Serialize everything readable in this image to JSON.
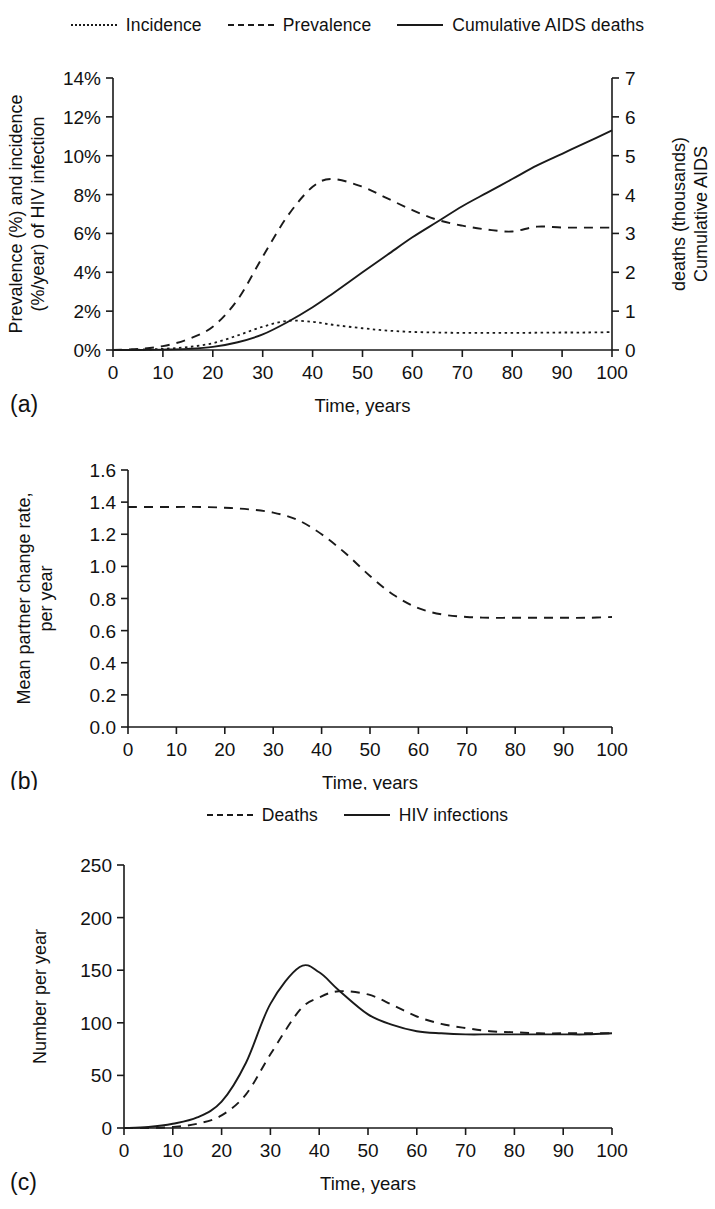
{
  "figure": {
    "panels": [
      "(a)",
      "(b)",
      "(c)"
    ],
    "x_axis_title": "Time, years"
  },
  "panel_a": {
    "tag": "(a)",
    "legend": [
      {
        "label": "Incidence",
        "style": "dotted"
      },
      {
        "label": "Prevalence",
        "style": "dashed"
      },
      {
        "label": "Cumulative AIDS deaths",
        "style": "solid"
      }
    ],
    "y_left_label_line1": "Prevalence (%) and incidence",
    "y_left_label_line2": "(%/year) of HIV infection",
    "y_right_label_line1": "Cumulative AIDS",
    "y_right_label_line2": "deaths (thousands)",
    "x_label": "Time, years",
    "y_left_ticks": [
      "0%",
      "2%",
      "4%",
      "6%",
      "8%",
      "10%",
      "12%",
      "14%"
    ],
    "y_right_ticks": [
      "0",
      "1",
      "2",
      "3",
      "4",
      "5",
      "6",
      "7"
    ],
    "x_ticks": [
      "0",
      "10",
      "20",
      "30",
      "40",
      "50",
      "60",
      "70",
      "80",
      "90",
      "100"
    ]
  },
  "panel_b": {
    "tag": "(b)",
    "y_label_line1": "Mean partner change rate,",
    "y_label_line2": "per year",
    "x_label": "Time, years",
    "y_ticks": [
      "0.0",
      "0.2",
      "0.4",
      "0.6",
      "0.8",
      "1.0",
      "1.2",
      "1.4",
      "1.6"
    ],
    "x_ticks": [
      "0",
      "10",
      "20",
      "30",
      "40",
      "50",
      "60",
      "70",
      "80",
      "90",
      "100"
    ]
  },
  "panel_c": {
    "tag": "(c)",
    "legend": [
      {
        "label": "Deaths",
        "style": "dashed"
      },
      {
        "label": "HIV infections",
        "style": "solid"
      }
    ],
    "y_label": "Number per year",
    "x_label": "Time, years",
    "y_ticks": [
      "0",
      "50",
      "100",
      "150",
      "200",
      "250"
    ],
    "x_ticks": [
      "0",
      "10",
      "20",
      "30",
      "40",
      "50",
      "60",
      "70",
      "80",
      "90",
      "100"
    ]
  },
  "chart_data": [
    {
      "id": "a",
      "type": "line",
      "title": "",
      "xlabel": "Time, years",
      "ylabel": "Prevalence (%) and incidence (%/year) of HIV infection",
      "y2label": "Cumulative AIDS deaths (thousands)",
      "xlim": [
        0,
        100
      ],
      "ylim": [
        0,
        14
      ],
      "y2lim": [
        0,
        7
      ],
      "yticks": [
        0,
        2,
        4,
        6,
        8,
        10,
        12,
        14
      ],
      "y2ticks": [
        0,
        1,
        2,
        3,
        4,
        5,
        6,
        7
      ],
      "xticks": [
        0,
        10,
        20,
        30,
        40,
        50,
        60,
        70,
        80,
        90,
        100
      ],
      "grid": false,
      "legend_position": "top",
      "x": [
        0,
        5,
        10,
        15,
        20,
        25,
        30,
        35,
        40,
        44,
        50,
        55,
        60,
        65,
        70,
        75,
        80,
        85,
        90,
        95,
        100
      ],
      "series": [
        {
          "name": "Incidence",
          "style": "dotted",
          "axis": "left",
          "units": "%/year",
          "values": [
            0.0,
            0.02,
            0.06,
            0.15,
            0.35,
            0.75,
            1.2,
            1.5,
            1.45,
            1.3,
            1.12,
            1.0,
            0.93,
            0.9,
            0.88,
            0.88,
            0.88,
            0.89,
            0.9,
            0.9,
            0.92
          ]
        },
        {
          "name": "Prevalence",
          "style": "dashed",
          "axis": "left",
          "units": "%",
          "values": [
            0.0,
            0.05,
            0.2,
            0.55,
            1.2,
            2.6,
            4.8,
            6.9,
            8.4,
            8.8,
            8.4,
            7.8,
            7.2,
            6.7,
            6.4,
            6.2,
            6.1,
            6.35,
            6.3,
            6.3,
            6.3
          ]
        },
        {
          "name": "Cumulative AIDS deaths",
          "style": "solid",
          "axis": "right",
          "units": "thousands",
          "values": [
            0.0,
            0.0,
            0.01,
            0.03,
            0.08,
            0.2,
            0.4,
            0.72,
            1.1,
            1.45,
            2.0,
            2.45,
            2.9,
            3.3,
            3.7,
            4.05,
            4.4,
            4.75,
            5.05,
            5.35,
            5.65
          ]
        }
      ]
    },
    {
      "id": "b",
      "type": "line",
      "title": "",
      "xlabel": "Time, years",
      "ylabel": "Mean partner change rate, per year",
      "xlim": [
        0,
        100
      ],
      "ylim": [
        0.0,
        1.6
      ],
      "yticks": [
        0.0,
        0.2,
        0.4,
        0.6,
        0.8,
        1.0,
        1.2,
        1.4,
        1.6
      ],
      "xticks": [
        0,
        10,
        20,
        30,
        40,
        50,
        60,
        70,
        80,
        90,
        100
      ],
      "grid": false,
      "legend_position": "none",
      "x": [
        0,
        5,
        10,
        15,
        20,
        25,
        30,
        35,
        40,
        45,
        50,
        55,
        60,
        65,
        70,
        75,
        80,
        85,
        90,
        95,
        100
      ],
      "series": [
        {
          "name": "Mean partner change rate",
          "style": "dashed",
          "axis": "left",
          "units": "per year",
          "values": [
            1.37,
            1.37,
            1.37,
            1.37,
            1.365,
            1.355,
            1.335,
            1.29,
            1.2,
            1.08,
            0.94,
            0.82,
            0.74,
            0.7,
            0.685,
            0.68,
            0.68,
            0.68,
            0.68,
            0.68,
            0.685
          ]
        }
      ]
    },
    {
      "id": "c",
      "type": "line",
      "title": "",
      "xlabel": "Time, years",
      "ylabel": "Number per year",
      "xlim": [
        0,
        100
      ],
      "ylim": [
        0,
        250
      ],
      "yticks": [
        0,
        50,
        100,
        150,
        200,
        250
      ],
      "xticks": [
        0,
        10,
        20,
        30,
        40,
        50,
        60,
        70,
        80,
        90,
        100
      ],
      "grid": false,
      "legend_position": "top",
      "x": [
        0,
        5,
        10,
        15,
        20,
        25,
        30,
        36,
        40,
        44,
        50,
        55,
        60,
        65,
        70,
        75,
        80,
        85,
        90,
        95,
        100
      ],
      "series": [
        {
          "name": "HIV infections",
          "style": "solid",
          "axis": "left",
          "units": "per year",
          "values": [
            0,
            1,
            4,
            10,
            25,
            62,
            118,
            153,
            148,
            131,
            108,
            98,
            92,
            90,
            89,
            89,
            89,
            89,
            89,
            89,
            90
          ]
        },
        {
          "name": "Deaths",
          "style": "dashed",
          "axis": "left",
          "units": "per year",
          "values": [
            0,
            0,
            1,
            4,
            12,
            32,
            70,
            112,
            124,
            130,
            127,
            117,
            106,
            99,
            95,
            92,
            91,
            90,
            90,
            90,
            90
          ]
        }
      ]
    }
  ]
}
